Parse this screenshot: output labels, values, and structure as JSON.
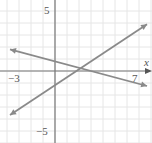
{
  "chart_data": {
    "type": "line",
    "title": "",
    "xlabel": "x",
    "ylabel": "",
    "xlim": [
      -3.75,
      7.8
    ],
    "ylim": [
      -6,
      6
    ],
    "grid": true,
    "x_tick_labels": [
      "-3",
      "7"
    ],
    "y_tick_labels": [
      "5",
      "-5"
    ],
    "series": [
      {
        "name": "rising-line",
        "x": [
          -3.75,
          7.67
        ],
        "y": [
          -3.67,
          3.9
        ],
        "color": "#8a8a8a"
      },
      {
        "name": "falling-line",
        "x": [
          -3.75,
          7.67
        ],
        "y": [
          1.8,
          -1.25
        ],
        "color": "#8a8a8a"
      }
    ],
    "intersection": [
      2,
      0
    ]
  },
  "labels": {
    "x_axis": "x",
    "x_min": "−3",
    "x_max": "7",
    "y_max": "5",
    "y_min": "−5"
  }
}
